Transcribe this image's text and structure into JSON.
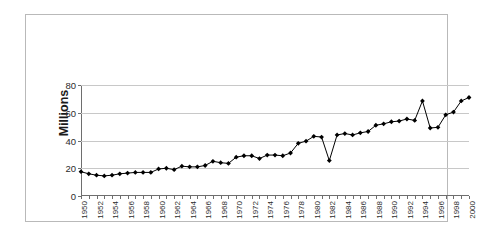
{
  "chart_data": {
    "type": "line",
    "title": "",
    "subtitle": "",
    "xlabel": "",
    "ylabel": "Millions",
    "ylim": [
      0,
      80
    ],
    "ytick_labels": [
      "0",
      "20",
      "40",
      "60",
      "80"
    ],
    "ytick_values": [
      0,
      20,
      40,
      60,
      80
    ],
    "grid": true,
    "legend": "none",
    "marker": "diamond",
    "line_color": "#000000",
    "marker_color": "#000000",
    "grid_color": "#c8c8c8",
    "axis_color": "#6e6e6e",
    "x": [
      1950,
      1951,
      1952,
      1953,
      1954,
      1955,
      1956,
      1957,
      1958,
      1959,
      1960,
      1961,
      1962,
      1963,
      1964,
      1965,
      1966,
      1967,
      1968,
      1969,
      1970,
      1971,
      1972,
      1973,
      1974,
      1975,
      1976,
      1977,
      1978,
      1979,
      1980,
      1981,
      1982,
      1983,
      1984,
      1985,
      1986,
      1987,
      1988,
      1989,
      1990,
      1991,
      1992,
      1993,
      1994,
      1995,
      1996,
      1997,
      1998,
      1999,
      2000
    ],
    "xtick_labels": [
      "1950",
      "1952",
      "1954",
      "1956",
      "1958",
      "1960",
      "1962",
      "1964",
      "1966",
      "1968",
      "1970",
      "1972",
      "1974",
      "1976",
      "1978",
      "1980",
      "1982",
      "1984",
      "1986",
      "1988",
      "1990",
      "1992",
      "1994",
      "1996",
      "1998",
      "2000"
    ],
    "values": [
      17.5,
      16,
      15,
      14.5,
      15,
      16,
      16.5,
      17,
      17,
      17,
      19.5,
      20,
      19,
      21.5,
      21,
      21,
      22,
      25,
      24,
      23.5,
      28,
      29,
      29,
      27,
      29.5,
      29.5,
      29,
      31,
      38,
      39.5,
      43,
      42.5,
      25.5,
      44,
      45,
      44,
      45.5,
      46.5,
      51,
      52,
      53.5,
      54,
      55.5,
      54.5,
      68.5,
      49,
      49.5,
      58.5,
      60.5,
      68.5,
      71
    ]
  },
  "axis": {
    "y_title": "Millions"
  }
}
